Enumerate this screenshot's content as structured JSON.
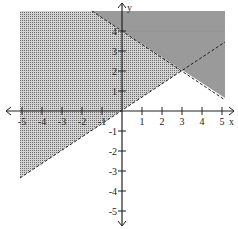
{
  "chart_data": {
    "type": "inequality-region",
    "title": "",
    "xlabel": "x",
    "ylabel": "y",
    "xlim": [
      -5,
      5
    ],
    "ylim": [
      -5,
      5
    ],
    "x_ticks": [
      "-5",
      "-4",
      "-3",
      "-2",
      "-1",
      "1",
      "2",
      "3",
      "4",
      "5"
    ],
    "y_ticks": [
      "-5",
      "-4",
      "-3",
      "-2",
      "-1",
      "1",
      "2",
      "3",
      "4"
    ],
    "series": [
      {
        "name": "boundary line 1",
        "equation": "y = (2/3)x",
        "style": "dashed",
        "points": [
          [
            -5,
            -3.33
          ],
          [
            3,
            2
          ],
          [
            5,
            3.33
          ]
        ],
        "shade": "above",
        "fill": "dotted"
      },
      {
        "name": "boundary line 2",
        "equation": "y = -(2/3)x + 4",
        "style": "dashed",
        "points": [
          [
            -1.5,
            5
          ],
          [
            0,
            4
          ],
          [
            3,
            2
          ],
          [
            5,
            0.67
          ]
        ],
        "shade": "above",
        "fill": "solid gray"
      }
    ],
    "intersection": [
      3,
      2
    ],
    "grid": false
  },
  "labels": {
    "x_axis": "x",
    "y_axis": "y",
    "xticks": [
      {
        "v": -5,
        "t": "-5"
      },
      {
        "v": -4,
        "t": "-4"
      },
      {
        "v": -3,
        "t": "-3"
      },
      {
        "v": -2,
        "t": "-2"
      },
      {
        "v": -1,
        "t": "-1"
      },
      {
        "v": 1,
        "t": "1"
      },
      {
        "v": 2,
        "t": "2"
      },
      {
        "v": 3,
        "t": "3"
      },
      {
        "v": 4,
        "t": "4"
      },
      {
        "v": 5,
        "t": "5"
      }
    ],
    "yticks": [
      {
        "v": 4,
        "t": "4"
      },
      {
        "v": 3,
        "t": "3"
      },
      {
        "v": 2,
        "t": "2"
      },
      {
        "v": 1,
        "t": "1"
      },
      {
        "v": -1,
        "t": "-1"
      },
      {
        "v": -2,
        "t": "-2"
      },
      {
        "v": -3,
        "t": "-3"
      },
      {
        "v": -4,
        "t": "-4"
      },
      {
        "v": -5,
        "t": "-5"
      }
    ]
  },
  "colors": {
    "solid_region": "#9a9a9a",
    "dot": "#6e6e6e",
    "axis": "#222222"
  }
}
